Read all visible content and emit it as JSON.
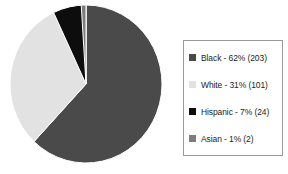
{
  "chart_data": {
    "type": "pie",
    "title": "",
    "xlabel": "",
    "ylabel": "",
    "grid": false,
    "legend_position": "right",
    "start_angle_deg": 0,
    "direction": "clockwise",
    "total_count": 330,
    "categories": [
      "Black",
      "White",
      "Hispanic",
      "Asian"
    ],
    "values": [
      62,
      31,
      7,
      1
    ],
    "counts": [
      203,
      101,
      24,
      2
    ],
    "slices": [
      {
        "label": "Black",
        "percent": 62,
        "count": 203,
        "color": "#4a4a4a",
        "start_deg": 0,
        "end_deg": 223.2,
        "legend_text": "Black - 62% (203)"
      },
      {
        "label": "White",
        "percent": 31,
        "count": 101,
        "color": "#e2e2e2",
        "start_deg": 223.2,
        "end_deg": 334.8,
        "legend_text": "White - 31% (101)"
      },
      {
        "label": "Hispanic",
        "percent": 7,
        "count": 24,
        "color": "#0d0d0d",
        "start_deg": 334.8,
        "end_deg": 360.0,
        "legend_text": "Hispanic - 7% (24)"
      },
      {
        "label": "Asian",
        "percent": 1,
        "count": 2,
        "color": "#7d7d7d",
        "start_deg": 356.4,
        "end_deg": 360.0,
        "legend_text": "Asian - 1% (2)"
      }
    ]
  },
  "legend": {
    "items": [
      {
        "swatch_color": "#4a4a4a",
        "text": "Black - 62% (203)"
      },
      {
        "swatch_color": "#e2e2e2",
        "text": "White - 31% (101)"
      },
      {
        "swatch_color": "#0d0d0d",
        "text": "Hispanic - 7% (24)"
      },
      {
        "swatch_color": "#7d7d7d",
        "text": "Asian - 1% (2)"
      }
    ]
  },
  "colors": {
    "background": "#ffffff",
    "legend_border": "#9a9a9a",
    "text": "#1d1d1d",
    "slice_divider": "#ffffff"
  }
}
